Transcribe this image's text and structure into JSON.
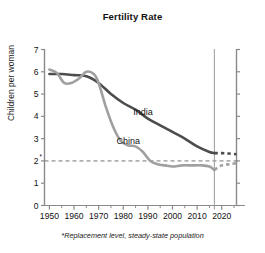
{
  "chart_data": {
    "type": "line",
    "title": "Fertility Rate",
    "xlabel": "",
    "ylabel": "Children per woman",
    "xlim": [
      1948,
      2026
    ],
    "ylim": [
      0,
      7
    ],
    "grid": false,
    "legend": "inline-labels",
    "x_ticks_major": [
      "1950",
      "1960",
      "1970",
      "1980",
      "1990",
      "2000",
      "2010",
      "2020"
    ],
    "x_ticks_major_values": [
      1950,
      1960,
      1970,
      1980,
      1990,
      2000,
      2010,
      2020
    ],
    "x_ticks_minor_values": [
      1955,
      1965,
      1975,
      1985,
      1995,
      2005,
      2015,
      2025
    ],
    "y_ticks": [
      "0",
      "1",
      "2*",
      "3",
      "4",
      "5",
      "6",
      "7"
    ],
    "y_tick_values": [
      0,
      1,
      2,
      3,
      4,
      5,
      6,
      7
    ],
    "replacement_level": 2.0,
    "replacement_note": "*Replacement level, steady-state population",
    "projection_divider_year": 2017,
    "series": [
      {
        "name": "India",
        "color": "#4d4d4d",
        "label": "India",
        "label_x": 1988,
        "label_y": 4.05,
        "x": [
          1950,
          1955,
          1960,
          1965,
          1970,
          1975,
          1980,
          1985,
          1990,
          1995,
          2000,
          2005,
          2010,
          2015,
          2017
        ],
        "values": [
          5.9,
          5.9,
          5.85,
          5.8,
          5.5,
          5.0,
          4.6,
          4.3,
          3.9,
          3.6,
          3.3,
          3.0,
          2.65,
          2.4,
          2.35
        ],
        "projection_x": [
          2017,
          2020,
          2023,
          2026
        ],
        "projection_values": [
          2.35,
          2.35,
          2.33,
          2.3
        ]
      },
      {
        "name": "China",
        "color": "#a0a0a0",
        "label": "China",
        "label_x": 1982,
        "label_y": 2.75,
        "x": [
          1950,
          1953,
          1956,
          1959,
          1962,
          1965,
          1968,
          1970,
          1973,
          1976,
          1979,
          1982,
          1985,
          1988,
          1991,
          1994,
          1997,
          2000,
          2004,
          2008,
          2012,
          2015,
          2017
        ],
        "values": [
          6.1,
          5.95,
          5.5,
          5.5,
          5.7,
          6.0,
          5.9,
          5.5,
          4.4,
          3.5,
          2.9,
          2.7,
          2.65,
          2.4,
          2.0,
          1.85,
          1.8,
          1.75,
          1.8,
          1.8,
          1.8,
          1.75,
          1.6
        ],
        "projection_x": [
          2017,
          2020,
          2023,
          2026
        ],
        "projection_values": [
          1.6,
          1.8,
          1.85,
          1.9
        ]
      }
    ]
  },
  "axes": {
    "left_axis_name": "left-y-axis",
    "bottom_axis_name": "bottom-x-axis",
    "right_axis_name": "right-y-axis"
  }
}
